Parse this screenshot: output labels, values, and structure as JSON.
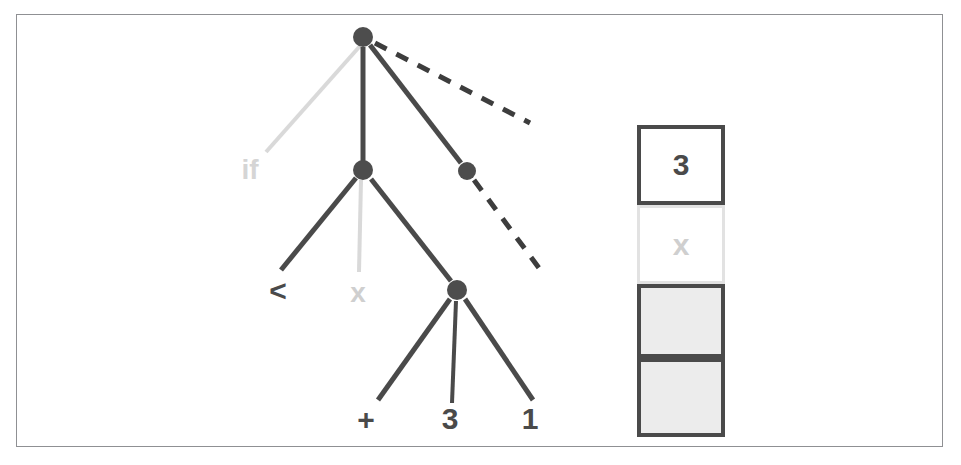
{
  "figure": {
    "kind": "ast-with-value-stack-diagram",
    "frame": {
      "border_color": "#8f9093",
      "background": "#ffffff"
    }
  },
  "palette": {
    "node_dark": "#4d4d4d",
    "edge_dark": "#4a4a4a",
    "edge_light": "#d9d9d9",
    "label_dark": "#4a4a4a",
    "label_light": "#cfcfcf",
    "cell_border_dark": "#4a4a4a",
    "cell_border_light": "#e2e2e2",
    "cell_fill_white": "#ffffff",
    "cell_fill_gray": "#ececec",
    "frame_border": "#8f9093",
    "background": "#ffffff"
  },
  "tree": {
    "nodes": [
      {
        "id": "root",
        "label": "",
        "cx": 363,
        "cy": 37,
        "r": 10,
        "color": "#4d4d4d"
      },
      {
        "id": "mid",
        "label": "",
        "cx": 363,
        "cy": 170,
        "r": 10,
        "color": "#4d4d4d"
      },
      {
        "id": "right",
        "label": "",
        "cx": 467,
        "cy": 171,
        "r": 9,
        "color": "#4d4d4d"
      },
      {
        "id": "lower",
        "label": "",
        "cx": 457,
        "cy": 290,
        "r": 10,
        "color": "#4d4d4d"
      }
    ],
    "edges": [
      {
        "id": "root-if",
        "from": "root",
        "to": "if-label",
        "x1": 360,
        "y1": 46,
        "x2": 266,
        "y2": 152,
        "style": "solid",
        "color": "#d9d9d9",
        "width": 4
      },
      {
        "id": "root-mid",
        "from": "root",
        "to": "mid",
        "x1": 363,
        "y1": 47,
        "x2": 363,
        "y2": 161,
        "style": "solid",
        "color": "#4a4a4a",
        "width": 5
      },
      {
        "id": "root-right",
        "from": "root",
        "to": "right",
        "x1": 370,
        "y1": 45,
        "x2": 461,
        "y2": 163,
        "style": "solid",
        "color": "#4a4a4a",
        "width": 5
      },
      {
        "id": "root-dashed",
        "from": "root",
        "to": "",
        "x1": 375,
        "y1": 43,
        "x2": 530,
        "y2": 123,
        "style": "dashed",
        "color": "#3d3d3d",
        "width": 5
      },
      {
        "id": "right-dashed",
        "from": "right",
        "to": "",
        "x1": 474,
        "y1": 180,
        "x2": 542,
        "y2": 272,
        "style": "dashed",
        "color": "#3d3d3d",
        "width": 5
      },
      {
        "id": "mid-lt",
        "from": "mid",
        "to": "lt-label",
        "x1": 356,
        "y1": 178,
        "x2": 281,
        "y2": 270,
        "style": "solid",
        "color": "#4a4a4a",
        "width": 5
      },
      {
        "id": "mid-x",
        "from": "mid",
        "to": "x-label",
        "x1": 361,
        "y1": 180,
        "x2": 359,
        "y2": 272,
        "style": "solid",
        "color": "#d9d9d9",
        "width": 4
      },
      {
        "id": "mid-lower",
        "from": "mid",
        "to": "lower",
        "x1": 371,
        "y1": 179,
        "x2": 451,
        "y2": 281,
        "style": "solid",
        "color": "#4a4a4a",
        "width": 5
      },
      {
        "id": "lower-plus",
        "from": "lower",
        "to": "plus-label",
        "x1": 450,
        "y1": 299,
        "x2": 378,
        "y2": 400,
        "style": "solid",
        "color": "#4a4a4a",
        "width": 5
      },
      {
        "id": "lower-three",
        "from": "lower",
        "to": "three-label",
        "x1": 456,
        "y1": 301,
        "x2": 452,
        "y2": 403,
        "style": "solid",
        "color": "#4a4a4a",
        "width": 4
      },
      {
        "id": "lower-one",
        "from": "lower",
        "to": "one-label",
        "x1": 465,
        "y1": 299,
        "x2": 533,
        "y2": 400,
        "style": "solid",
        "color": "#4a4a4a",
        "width": 5
      }
    ],
    "labels": [
      {
        "id": "if-label",
        "text": "if",
        "x": 250,
        "y": 170,
        "size": 28,
        "color": "#d5d5d5"
      },
      {
        "id": "lt-label",
        "text": "<",
        "x": 278,
        "y": 291,
        "size": 30,
        "color": "#4a4a4a"
      },
      {
        "id": "x-label",
        "text": "x",
        "x": 358,
        "y": 293,
        "size": 28,
        "color": "#cfcfcf"
      },
      {
        "id": "plus-label",
        "text": "+",
        "x": 366,
        "y": 420,
        "size": 30,
        "color": "#4a4a4a"
      },
      {
        "id": "three-label",
        "text": "3",
        "x": 450,
        "y": 419,
        "size": 30,
        "color": "#4a4a4a"
      },
      {
        "id": "one-label",
        "text": "1",
        "x": 530,
        "y": 419,
        "size": 30,
        "color": "#4a4a4a"
      }
    ]
  },
  "stack": {
    "cells": [
      {
        "id": "cell-3",
        "text": "3",
        "top": 0,
        "height": 80,
        "fill": "#ffffff",
        "border_color": "#4a4a4a",
        "border_width": 4,
        "text_color": "#4a4a4a"
      },
      {
        "id": "cell-x",
        "text": "x",
        "top": 80,
        "height": 79,
        "fill": "#ffffff",
        "border_color": "#e2e2e2",
        "border_width": 3,
        "text_color": "#cfcfcf"
      },
      {
        "id": "cell-empty1",
        "text": "",
        "top": 159,
        "height": 74,
        "fill": "#ececec",
        "border_color": "#4a4a4a",
        "border_width": 4,
        "text_color": "#4a4a4a"
      },
      {
        "id": "cell-empty2",
        "text": "",
        "top": 233,
        "height": 79,
        "fill": "#ececec",
        "border_color": "#4a4a4a",
        "border_width": 4,
        "text_color": "#4a4a4a"
      }
    ]
  }
}
